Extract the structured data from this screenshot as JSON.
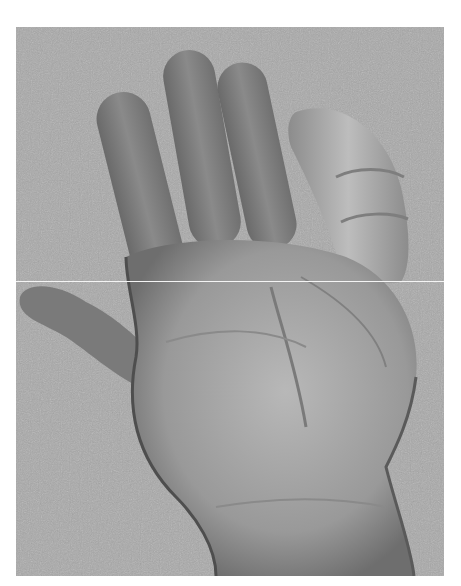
{
  "image": {
    "subject": "grayscale photograph of a child's open palm against a textured background",
    "colors": {
      "background_texture": "#a9a9a9",
      "skin_dark": "#6a6a6a",
      "skin_mid": "#8e8e8e",
      "skin_light": "#b5b5b5",
      "seam_line": "#f4f4f4",
      "page": "#ffffff"
    },
    "frame": {
      "x": 16,
      "y": 27,
      "width": 428,
      "height": 549
    },
    "seam_y": 281
  }
}
